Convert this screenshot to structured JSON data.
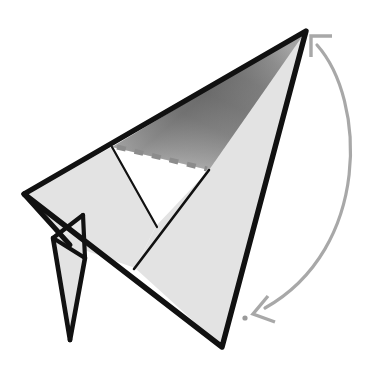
{
  "canvas": {
    "width": 391,
    "height": 374,
    "background": "#ffffff",
    "title": "Origami fold step diagram"
  },
  "style": {
    "paper_light": "#e3e3e3",
    "paper_shade_dark": "#6f6f6f",
    "paper_shade_mid": "#9a9a9a",
    "paper_shade_light": "#d2d2d2",
    "edge_color": "#111111",
    "edge_width_major": 5,
    "edge_width_minor": 2,
    "fold_dash_color": "#8c8c8c",
    "fold_dash_width": 5,
    "fold_dash_pattern": "9 9",
    "arrow_color": "#a8a8a8",
    "arrow_width": 3,
    "dot_color": "#9a9a9a"
  },
  "shapes": {
    "upper_wing_shaded": {
      "name": "upper-shaded-triangle",
      "points": "306,31 112,147 209,170",
      "fill": "shade-gradient"
    },
    "left_wing_panel": {
      "name": "left-wing-panel",
      "points": "112,147 24,194 70,245 135,268 156,226",
      "fill": "#e3e3e3"
    },
    "right_body_panel": {
      "name": "right-body-panel",
      "points": "306,31 209,170 156,226 135,268 222,347",
      "fill": "#e3e3e3"
    },
    "lower_leg": {
      "name": "lower-leg-flap",
      "points": "53,238 83,232 85,258 70,340",
      "fill": "#e3e3e3"
    },
    "leg_notch": {
      "name": "leg-notch-triangle",
      "points": "53,238 83,215 85,258",
      "fill": "#e3e3e3"
    }
  },
  "edges": [
    {
      "name": "edge-apex-to-left-tip",
      "from": "306,31",
      "to": "24,194",
      "weight": "major"
    },
    {
      "name": "edge-apex-to-tail",
      "from": "306,31",
      "to": "222,347",
      "weight": "major"
    },
    {
      "name": "edge-left-tip-to-tail",
      "from": "24,194",
      "to": "222,347",
      "weight": "major"
    },
    {
      "name": "edge-internal-crease",
      "from": "112,147",
      "to": "156,226",
      "weight": "minor"
    },
    {
      "name": "edge-crossing-fold",
      "from": "209,170",
      "to": "135,268",
      "weight": "minor"
    },
    {
      "name": "edge-leg-left",
      "from": "53,238",
      "to": "70,340",
      "weight": "major"
    },
    {
      "name": "edge-leg-right",
      "from": "85,258",
      "to": "70,340",
      "weight": "major"
    },
    {
      "name": "edge-leg-top",
      "from": "53,238",
      "to": "85,258",
      "weight": "major"
    },
    {
      "name": "edge-leg-notch",
      "from": "53,238",
      "to": "83,215",
      "weight": "major"
    },
    {
      "name": "edge-leg-spine",
      "from": "83,215",
      "to": "85,258",
      "weight": "major"
    }
  ],
  "fold_line": {
    "name": "valley-fold-dashed-line",
    "from": "117,147",
    "to": "207,169",
    "type": "dashed"
  },
  "arrow": {
    "name": "fold-rotation-arrow",
    "description": "Curved double-headed arrow sweeping from lower-left target dot up and around to the apex",
    "path": "M 316,43 C 368,95 372,250 262,310",
    "head_top": {
      "name": "arrow-head-top",
      "tip": "310,35",
      "direction": "up-left"
    },
    "head_bottom": {
      "name": "arrow-head-bottom",
      "tip": "252,314",
      "direction": "down-left"
    },
    "target_dot": {
      "name": "target-reference-dot",
      "cx": 245,
      "cy": 318,
      "r": 2.6
    }
  },
  "labels": {
    "alt_text": "Origami instruction diagram showing a paper model with a shaded wing, a dashed valley fold line, and a curved arrow indicating the fold direction.",
    "caption": ""
  }
}
